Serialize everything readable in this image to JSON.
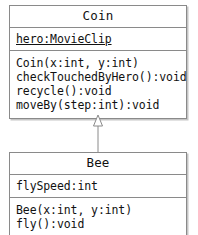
{
  "diagram": {
    "type": "uml-class-diagram",
    "classes": [
      {
        "id": "coin",
        "name": "Coin",
        "attributes": [
          {
            "text": "hero:MovieClip",
            "static": true
          }
        ],
        "operations": [
          {
            "text": "Coin(x:int, y:int)"
          },
          {
            "text": "checkTouchedByHero():void"
          },
          {
            "text": "recycle():void"
          },
          {
            "text": "moveBy(step:int):void"
          }
        ]
      },
      {
        "id": "bee",
        "name": "Bee",
        "attributes": [
          {
            "text": "flySpeed:int",
            "static": false
          }
        ],
        "operations": [
          {
            "text": "Bee(x:int, y:int)"
          },
          {
            "text": "fly():void"
          }
        ]
      }
    ],
    "relationships": [
      {
        "kind": "generalization",
        "label": "inheritance-arrow",
        "from": "Bee",
        "to": "Coin",
        "arrowhead": "hollow-triangle"
      }
    ],
    "colors": {
      "border": "#8a8a8a",
      "fill": "#ffffff",
      "text": "#111111",
      "shadow": "#969696"
    }
  }
}
